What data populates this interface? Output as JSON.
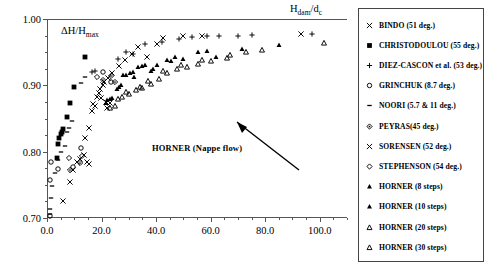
{
  "chart_data": {
    "type": "scatter",
    "title": "",
    "xlabel": "Hdam/dc",
    "ylabel": "DH/Hmax",
    "xlim": [
      0.0,
      110.0
    ],
    "ylim": [
      0.7,
      1.0
    ],
    "grid": false,
    "legend_position": "right-outside",
    "xticks": [
      "0.0",
      "20.0",
      "40.0",
      "60.0",
      "80.0",
      "100.0"
    ],
    "xtick_values": [
      0,
      20,
      40,
      60,
      80,
      100
    ],
    "yticks": [
      "0.70",
      "0.80",
      "0.90",
      "1.00"
    ],
    "ytick_values": [
      0.7,
      0.8,
      0.9,
      1.0
    ],
    "x_minor_step": 5,
    "y_minor_step": 0.025,
    "annotations": [
      {
        "text": "HORNER (Nappe flow)",
        "x": 46.0,
        "y": 0.838,
        "arrow_to_x": 38.5,
        "arrow_to_y": 0.893
      }
    ],
    "series": [
      {
        "name": "BINDO (51 deg.)",
        "marker": "cross-x",
        "fill": "none",
        "points": [
          [
            6.0,
            0.726
          ],
          [
            8.5,
            0.754
          ],
          [
            9.5,
            0.772
          ],
          [
            11.0,
            0.784
          ],
          [
            12.0,
            0.789
          ],
          [
            13.5,
            0.795
          ],
          [
            14.0,
            0.82
          ],
          [
            15.5,
            0.836
          ],
          [
            16.5,
            0.861
          ],
          [
            17.5,
            0.869
          ],
          [
            18.5,
            0.883
          ],
          [
            19.0,
            0.889
          ],
          [
            19.5,
            0.894
          ],
          [
            20.5,
            0.9
          ],
          [
            21.0,
            0.905
          ],
          [
            22.5,
            0.911
          ],
          [
            24.0,
            0.918
          ],
          [
            26.5,
            0.929
          ],
          [
            28.5,
            0.938
          ],
          [
            31.0,
            0.947
          ],
          [
            33.5,
            0.958
          ],
          [
            36.5,
            0.943
          ],
          [
            40.5,
            0.963
          ],
          [
            42.5,
            0.972
          ],
          [
            50.0,
            0.974
          ],
          [
            57.0,
            0.975
          ],
          [
            93.0,
            0.978
          ],
          [
            21.5,
            0.875
          ],
          [
            19.8,
            0.881
          ],
          [
            23.0,
            0.873
          ]
        ]
      },
      {
        "name": "CHRISTODOULOU (55 deg.)",
        "marker": "square-filled",
        "fill": "solid",
        "points": [
          [
            3.5,
            0.79
          ],
          [
            4.0,
            0.812
          ],
          [
            4.5,
            0.82
          ],
          [
            5.0,
            0.826
          ],
          [
            5.5,
            0.83
          ],
          [
            6.0,
            0.834
          ],
          [
            7.5,
            0.853
          ],
          [
            8.5,
            0.873
          ],
          [
            10.0,
            0.897
          ],
          [
            14.0,
            0.943
          ]
        ]
      },
      {
        "name": "DIEZ-CASCON et al. (53 deg.)",
        "marker": "plus",
        "fill": "none",
        "points": [
          [
            16.5,
            0.92
          ],
          [
            17.5,
            0.921
          ],
          [
            26.0,
            0.94
          ],
          [
            29.0,
            0.95
          ],
          [
            31.5,
            0.947
          ],
          [
            36.0,
            0.963
          ],
          [
            42.0,
            0.966
          ],
          [
            48.5,
            0.97
          ],
          [
            53.0,
            0.973
          ],
          [
            58.5,
            0.975
          ],
          [
            63.0,
            0.975
          ],
          [
            70.0,
            0.975
          ],
          [
            75.0,
            0.976
          ],
          [
            97.0,
            0.978
          ]
        ]
      },
      {
        "name": "GRINCHUK (8.7 deg.)",
        "marker": "circle-open",
        "fill": "none",
        "points": [
          [
            1.0,
            0.703
          ],
          [
            1.2,
            0.758
          ],
          [
            1.5,
            0.785
          ],
          [
            4.0,
            0.774
          ],
          [
            9.5,
            0.777
          ],
          [
            12.5,
            0.806
          ],
          [
            20.5,
            0.92
          ],
          [
            23.5,
            0.905
          ]
        ]
      },
      {
        "name": "NOORI (5.7 & 11 deg.)",
        "marker": "dash",
        "fill": "solid",
        "points": [
          [
            1.0,
            0.706
          ],
          [
            1.2,
            0.713
          ],
          [
            1.5,
            0.73
          ],
          [
            2.0,
            0.748
          ],
          [
            3.0,
            0.768
          ],
          [
            4.0,
            0.788
          ],
          [
            5.0,
            0.8
          ],
          [
            6.5,
            0.809
          ],
          [
            9.0,
            0.846
          ],
          [
            12.5,
            0.903
          ],
          [
            14.0,
            0.913
          ],
          [
            8.0,
            0.836
          ],
          [
            7.5,
            0.83
          ]
        ]
      },
      {
        "name": "PEYRAS(45 deg.)",
        "marker": "diamond-dot",
        "fill": "none",
        "points": [
          [
            8.5,
            0.772
          ],
          [
            12.0,
            0.783
          ],
          [
            20.5,
            0.908
          ],
          [
            23.5,
            0.914
          ],
          [
            25.0,
            0.905
          ]
        ]
      },
      {
        "name": "SORENSEN (52 deg.)",
        "marker": "cross-x",
        "fill": "none",
        "points": [
          [
            14.5,
            0.785
          ],
          [
            15.5,
            0.782
          ],
          [
            17.0,
            0.872
          ],
          [
            22.0,
            0.866
          ]
        ]
      },
      {
        "name": "STEPHENSON (54 deg.)",
        "marker": "diamond-open",
        "fill": "none",
        "points": [
          [
            8.0,
            0.79
          ],
          [
            13.0,
            0.793
          ],
          [
            18.5,
            0.913
          ]
        ]
      },
      {
        "name": "HORNER (8 steps)",
        "marker": "triangle-filled",
        "fill": "solid",
        "points": [
          [
            22.0,
            0.878
          ],
          [
            23.0,
            0.88
          ],
          [
            24.0,
            0.881
          ],
          [
            25.5,
            0.895
          ],
          [
            26.5,
            0.897
          ],
          [
            28.0,
            0.915
          ],
          [
            29.0,
            0.916
          ],
          [
            30.5,
            0.919
          ],
          [
            32.0,
            0.912
          ],
          [
            33.5,
            0.928
          ],
          [
            35.0,
            0.929
          ],
          [
            36.0,
            0.93
          ],
          [
            38.0,
            0.921
          ],
          [
            40.5,
            0.93
          ],
          [
            44.0,
            0.938
          ],
          [
            47.0,
            0.942
          ],
          [
            50.0,
            0.94
          ],
          [
            55.5,
            0.951
          ],
          [
            58.5,
            0.952
          ],
          [
            62.0,
            0.942
          ],
          [
            71.5,
            0.955
          ],
          [
            85.0,
            0.961
          ]
        ]
      },
      {
        "name": "HORNER (10 steps)",
        "marker": "triangle-filled",
        "fill": "solid",
        "points": [
          [
            21.5,
            0.873
          ],
          [
            27.0,
            0.9
          ],
          [
            31.5,
            0.92
          ],
          [
            39.0,
            0.925
          ],
          [
            45.5,
            0.937
          ]
        ]
      },
      {
        "name": "HORNER (20 steps)",
        "marker": "triangle-open",
        "fill": "none",
        "points": [
          [
            23.0,
            0.866
          ],
          [
            25.0,
            0.869
          ],
          [
            27.5,
            0.883
          ],
          [
            30.0,
            0.887
          ],
          [
            32.5,
            0.893
          ],
          [
            35.0,
            0.896
          ],
          [
            38.0,
            0.902
          ],
          [
            41.0,
            0.909
          ],
          [
            44.0,
            0.919
          ],
          [
            47.5,
            0.925
          ],
          [
            51.5,
            0.928
          ],
          [
            55.5,
            0.932
          ],
          [
            60.0,
            0.936
          ],
          [
            66.0,
            0.941
          ],
          [
            73.0,
            0.95
          ],
          [
            101.5,
            0.964
          ]
        ]
      },
      {
        "name": "HORNER (30 steps)",
        "marker": "triangle-open",
        "fill": "none",
        "points": [
          [
            26.0,
            0.88
          ],
          [
            29.0,
            0.89
          ],
          [
            34.0,
            0.898
          ],
          [
            37.0,
            0.906
          ],
          [
            42.5,
            0.921
          ],
          [
            49.0,
            0.93
          ],
          [
            57.0,
            0.938
          ],
          [
            67.0,
            0.945
          ],
          [
            79.0,
            0.953
          ]
        ]
      }
    ]
  },
  "legend": {
    "items": [
      {
        "label": "BINDO (51 deg.)",
        "marker": "cross-x"
      },
      {
        "label": "CHRISTODOULOU (55 deg.)",
        "marker": "square-filled"
      },
      {
        "label": "DIEZ-CASCON et al. (53 deg.)",
        "marker": "plus"
      },
      {
        "label": "GRINCHUK (8.7 deg.)",
        "marker": "circle-open"
      },
      {
        "label": "NOORI (5.7 & 11 deg.)",
        "marker": "dash"
      },
      {
        "label": "PEYRAS(45 deg.)",
        "marker": "diamond-dot"
      },
      {
        "label": "SORENSEN (52 deg.)",
        "marker": "cross-x"
      },
      {
        "label": "STEPHENSON (54 deg.)",
        "marker": "diamond-open"
      },
      {
        "label": "HORNER (8 steps)",
        "marker": "triangle-filled"
      },
      {
        "label": "HORNER (10 steps)",
        "marker": "triangle-filled"
      },
      {
        "label": "HORNER (20 steps)",
        "marker": "triangle-open"
      },
      {
        "label": "HORNER (30 steps)",
        "marker": "triangle-open"
      }
    ]
  },
  "axis_titles": {
    "y_prefix": "ΔH/H",
    "y_sub": "max",
    "x_prefix": "H",
    "x_sub1": "dam",
    "x_mid": "/d",
    "x_sub2": "c"
  },
  "annotation": {
    "text": "HORNER (Nappe flow)"
  },
  "colors": {
    "axis": "#555555",
    "marker": "#000000",
    "legend_border": "#444444",
    "background": "#ffffff"
  }
}
